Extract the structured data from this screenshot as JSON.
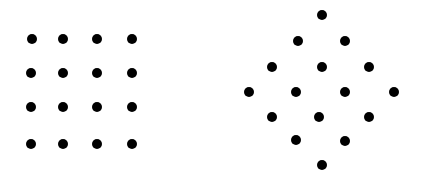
{
  "figures": [
    {
      "name": "square-grid",
      "shape": "4x4 square grid",
      "dot_color": "#000000",
      "dot_diameter": 10,
      "dots": [
        [
          32,
          39
        ],
        [
          63,
          39
        ],
        [
          97,
          39
        ],
        [
          132,
          39
        ],
        [
          31,
          73
        ],
        [
          63,
          73
        ],
        [
          97,
          73
        ],
        [
          132,
          73
        ],
        [
          31,
          107
        ],
        [
          63,
          107
        ],
        [
          97,
          107
        ],
        [
          132,
          107
        ],
        [
          31,
          144
        ],
        [
          63,
          144
        ],
        [
          97,
          144
        ],
        [
          132,
          144
        ]
      ]
    },
    {
      "name": "diamond-lattice",
      "shape": "4x4 grid rotated 45 degrees (diamond)",
      "dot_color": "#000000",
      "dot_diameter": 10,
      "dots": [
        [
          322,
          15
        ],
        [
          298,
          41
        ],
        [
          345,
          41
        ],
        [
          272,
          67
        ],
        [
          322,
          67
        ],
        [
          369,
          67
        ],
        [
          249,
          92
        ],
        [
          296,
          92
        ],
        [
          345,
          92
        ],
        [
          394,
          92
        ],
        [
          272,
          117
        ],
        [
          319,
          117
        ],
        [
          369,
          117
        ],
        [
          296,
          140
        ],
        [
          345,
          141
        ],
        [
          322,
          165
        ]
      ]
    }
  ]
}
